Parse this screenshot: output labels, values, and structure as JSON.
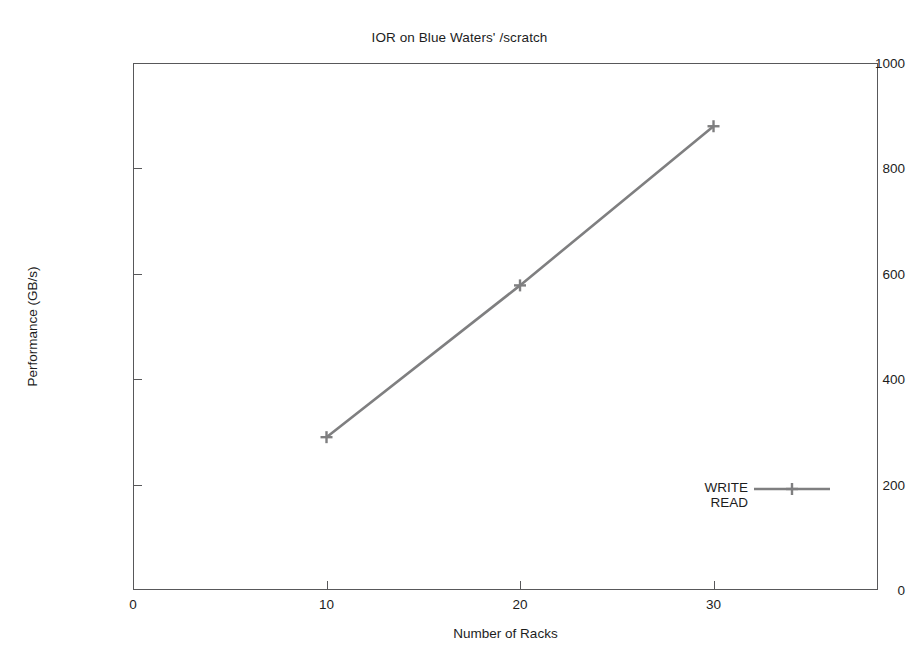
{
  "chart_data": {
    "type": "line",
    "title": "IOR on Blue Waters' /scratch",
    "xlabel": "Number of Racks",
    "ylabel": "Performance (GB/s)",
    "xlim": [
      0,
      38.5
    ],
    "ylim": [
      0,
      1000
    ],
    "xticks": [
      0,
      10,
      20,
      30
    ],
    "xtick_labels": [
      "0",
      "10",
      "20",
      "30"
    ],
    "yticks": [
      0,
      200,
      400,
      600,
      800,
      1000
    ],
    "ytick_labels": [
      "0",
      "200",
      "400",
      "600",
      "800",
      "1000"
    ],
    "grid": false,
    "legend_position": "inside-lower-right",
    "line_color": "#7f7f80",
    "marker": "cross",
    "series": [
      {
        "name": "WRITE",
        "x": [
          10,
          20,
          30
        ],
        "values": [
          290,
          578,
          880
        ],
        "color": "#7f7f80",
        "has_legend_sample": true
      },
      {
        "name": "READ",
        "x": [],
        "values": [],
        "color": "#ffffff",
        "has_legend_sample": false
      }
    ]
  },
  "axes": {
    "y_ticks": [
      {
        "label": "1000",
        "value": 1000
      },
      {
        "label": "800",
        "value": 800
      },
      {
        "label": "600",
        "value": 600
      },
      {
        "label": "400",
        "value": 400
      },
      {
        "label": "200",
        "value": 200
      },
      {
        "label": "0",
        "value": 0
      }
    ],
    "x_ticks": [
      {
        "label": "0",
        "value": 0
      },
      {
        "label": "10",
        "value": 10
      },
      {
        "label": "20",
        "value": 20
      },
      {
        "label": "30",
        "value": 30
      }
    ]
  },
  "legend": {
    "entries": [
      {
        "label": "WRITE"
      },
      {
        "label": "READ"
      }
    ]
  }
}
